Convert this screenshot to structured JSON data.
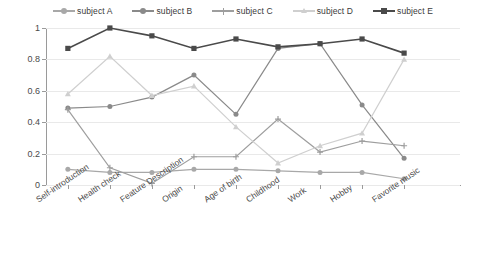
{
  "chart_data": {
    "type": "line",
    "title": "",
    "subtitle": "",
    "xlabel": "",
    "ylabel": "",
    "ylim": [
      0,
      1
    ],
    "yticks": [
      "0",
      "0.2",
      "0.4",
      "0.6",
      "0.8",
      "1"
    ],
    "ytick_values": [
      0,
      0.2,
      0.4,
      0.6,
      0.8,
      1
    ],
    "grid": true,
    "legend_position": "top",
    "categories": [
      "Self-introduction",
      "Health check",
      "Feature Description",
      "Origin",
      "Age of birth",
      "Childhood",
      "Work",
      "Hobby",
      "Favorite music"
    ],
    "series": [
      {
        "name": "subject A",
        "color": "#a8a8a8",
        "marker": "circle",
        "values": [
          0.1,
          0.08,
          0.08,
          0.1,
          0.1,
          0.09,
          0.08,
          0.08,
          0.04
        ]
      },
      {
        "name": "subject B",
        "color": "#8a8a8a",
        "marker": "circle",
        "values": [
          0.49,
          0.5,
          0.56,
          0.7,
          0.45,
          0.87,
          0.9,
          0.51,
          0.17
        ]
      },
      {
        "name": "subject C",
        "color": "#9e9e9e",
        "marker": "plus",
        "values": [
          0.48,
          0.11,
          0.01,
          0.18,
          0.18,
          0.42,
          0.21,
          0.28,
          0.25
        ]
      },
      {
        "name": "subject D",
        "color": "#cfcfcf",
        "marker": "triangle",
        "values": [
          0.58,
          0.82,
          0.57,
          0.63,
          0.37,
          0.14,
          0.25,
          0.33,
          0.8
        ]
      },
      {
        "name": "subject E",
        "color": "#4a4a4a",
        "marker": "square",
        "values": [
          0.87,
          1.0,
          0.95,
          0.87,
          0.93,
          0.88,
          0.9,
          0.93,
          0.84
        ]
      }
    ]
  },
  "legend": {
    "items": [
      {
        "label": "subject A"
      },
      {
        "label": "subject B"
      },
      {
        "label": "subject C"
      },
      {
        "label": "subject D"
      },
      {
        "label": "subject E"
      }
    ]
  }
}
